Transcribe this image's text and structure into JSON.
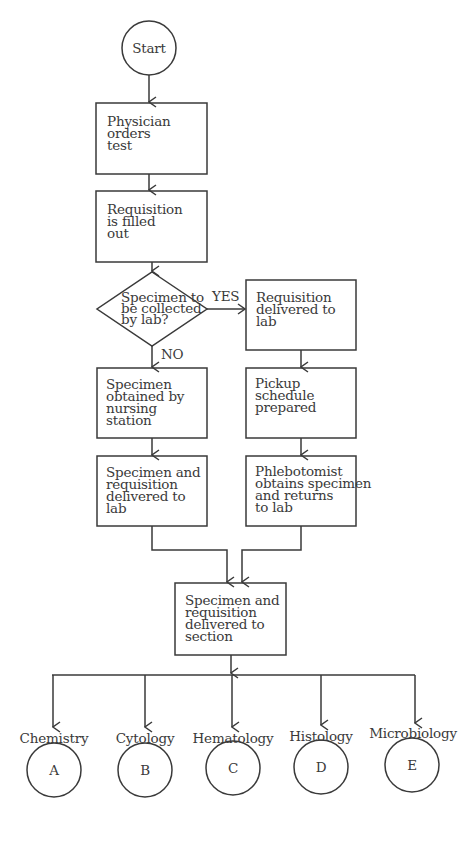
{
  "flowchart": {
    "start": {
      "label": "Start"
    },
    "steps": {
      "physician_orders": "Physician\norders\ntest",
      "requisition_filled": "Requisition\nis filled\nout",
      "decision": "Specimen to\nbe collected\nby lab?",
      "yes_label": "YES",
      "no_label": "NO",
      "requisition_delivered": "Requisition\ndelivered to\nlab",
      "nursing_obtained": "Specimen\nobtained by\nnursing\nstation",
      "pickup_schedule": "Pickup\nschedule\nprepared",
      "nursing_delivered": "Specimen and\nrequisition\ndelivered to\nlab",
      "phlebotomist": "Phlebotomist\nobtains specimen\nand returns\nto lab",
      "to_section": "Specimen and\nrequisition\ndelivered to\nsection"
    },
    "sections": [
      {
        "name": "Chemistry",
        "letter": "A"
      },
      {
        "name": "Cytology",
        "letter": "B"
      },
      {
        "name": "Hematology",
        "letter": "C"
      },
      {
        "name": "Histology",
        "letter": "D"
      },
      {
        "name": "Microbiology",
        "letter": "E"
      }
    ]
  },
  "colors": {
    "line": "#3a3a3a",
    "background": "#ffffff"
  }
}
